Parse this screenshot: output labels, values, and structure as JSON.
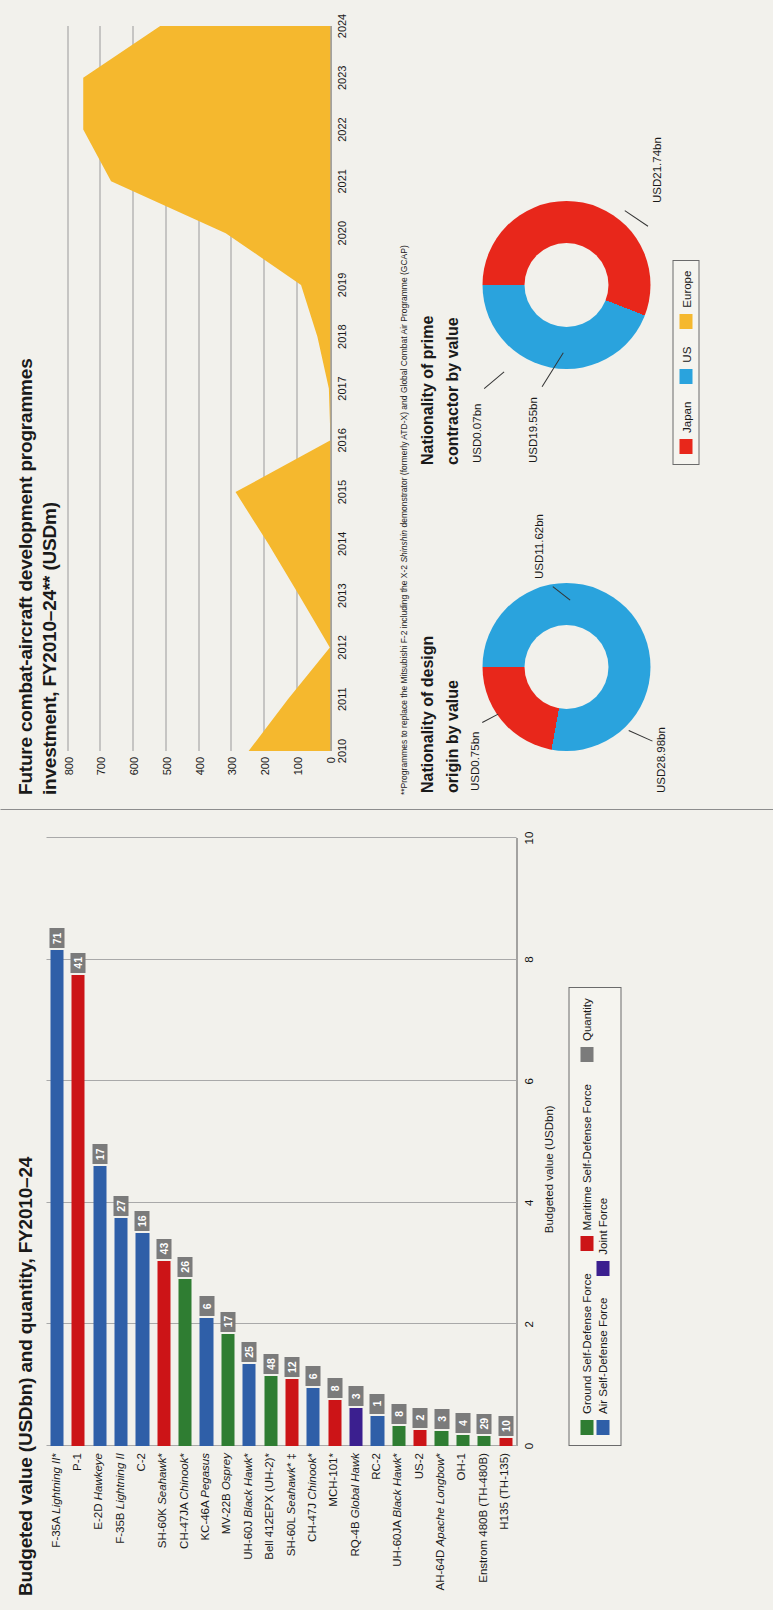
{
  "bar_panel": {
    "title": "Budgeted value (USDbn) and quantity, FY2010–24",
    "axis_title": "Budgeted value (USDbn)",
    "legend": [
      {
        "label": "Ground Self-Defense Force",
        "color": "#2f7d32"
      },
      {
        "label": "Maritime Self-Defense Force",
        "color": "#cc1417"
      },
      {
        "label": "Quantity",
        "color": "#7b7b7b"
      },
      {
        "label": "Air Self-Defense Force",
        "color": "#2f5fa8"
      },
      {
        "label": "Joint Force",
        "color": "#3b1f8f"
      }
    ]
  },
  "area_panel": {
    "title_line1": "Future combat-aircraft development programmes",
    "title_line2": "investment, FY2010–24** (USDm)",
    "footnote": "**Programmes to replace the Mitsubishi F-2 including the X-2 Shinshin demonstrator (formerly ATD-X) and Global Combat Air Programme (GCAP)",
    "footnote_italic": "Shinshin"
  },
  "donut_left": {
    "title_line1": "Nationality of design",
    "title_line2": "origin by value",
    "callouts": [
      {
        "name": "europe-callout",
        "text": "USD0.75bn"
      },
      {
        "name": "japan-callout",
        "text": "USD11.62bn"
      },
      {
        "name": "us-callout",
        "text": "USD28.98bn"
      }
    ]
  },
  "donut_right": {
    "title_line1": "Nationality of prime",
    "title_line2": "contractor by value",
    "callouts": [
      {
        "name": "europe-callout",
        "text": "USD0.07bn"
      },
      {
        "name": "us-callout",
        "text": "USD19.55bn"
      },
      {
        "name": "japan-callout",
        "text": "USD21.74bn"
      }
    ]
  },
  "donut_legend": [
    {
      "label": "Japan",
      "color": "#e8271b"
    },
    {
      "label": "US",
      "color": "#2aa3dd"
    },
    {
      "label": "Europe",
      "color": "#f5b82e"
    }
  ],
  "chart_data": [
    {
      "type": "bar",
      "name": "budgeted-value-and-quantity",
      "title": "Budgeted value (USDbn) and quantity, FY2010–24",
      "xlabel": "Budgeted value (USDbn)",
      "ylabel": "",
      "xlim": [
        0,
        10
      ],
      "xticks": [
        0,
        2,
        4,
        6,
        8,
        10
      ],
      "grid": true,
      "orientation": "horizontal",
      "legend_position": "bottom",
      "categories": [
        "F-35A Lightning II*",
        "P-1",
        "E-2D Hawkeye",
        "F-35B Lightning II",
        "C-2",
        "SH-60K Seahawk*",
        "CH-47JA Chinook*",
        "KC-46A Pegasus",
        "MV-22B Osprey",
        "UH-60J Black Hawk*",
        "Bell 412EPX (UH-2)*",
        "SH-60L Seahawk* ‡",
        "CH-47J Chinook*",
        "MCH-101*",
        "RQ-4B Global Hawk",
        "RC-2",
        "UH-60JA Black Hawk*",
        "US-2",
        "AH-64D Apache Longbow*",
        "OH-1",
        "Enstrom 480B (TH-480B)",
        "H135 (TH-135)"
      ],
      "italic_parts": [
        "Lightning II",
        "",
        "Hawkeye",
        "Lightning II",
        "",
        "Seahawk",
        "Chinook",
        "Pegasus",
        "Osprey",
        "Black Hawk",
        "",
        "Seahawk",
        "Chinook",
        "",
        "Global Hawk",
        "",
        "Black Hawk",
        "",
        "Apache Longbow",
        "",
        "",
        ""
      ],
      "values": [
        8.15,
        7.75,
        4.6,
        3.75,
        3.5,
        3.05,
        2.75,
        2.1,
        1.85,
        1.35,
        1.15,
        1.1,
        0.95,
        0.75,
        0.62,
        0.5,
        0.33,
        0.27,
        0.25,
        0.18,
        0.17,
        0.13
      ],
      "quantities": [
        71,
        41,
        17,
        27,
        16,
        43,
        26,
        6,
        17,
        25,
        48,
        12,
        6,
        8,
        3,
        1,
        8,
        2,
        3,
        4,
        29,
        10
      ],
      "series_colors": [
        "#2f5fa8",
        "#cc1417",
        "#2f5fa8",
        "#2f5fa8",
        "#2f5fa8",
        "#cc1417",
        "#2f7d32",
        "#2f5fa8",
        "#2f7d32",
        "#2f5fa8",
        "#2f7d32",
        "#cc1417",
        "#2f5fa8",
        "#cc1417",
        "#3b1f8f",
        "#2f5fa8",
        "#2f7d32",
        "#cc1417",
        "#2f7d32",
        "#2f7d32",
        "#2f7d32",
        "#cc1417"
      ],
      "force_of_category": [
        "Air Self-Defense Force",
        "Maritime Self-Defense Force",
        "Air Self-Defense Force",
        "Air Self-Defense Force",
        "Air Self-Defense Force",
        "Maritime Self-Defense Force",
        "Ground Self-Defense Force",
        "Air Self-Defense Force",
        "Ground Self-Defense Force",
        "Air Self-Defense Force",
        "Ground Self-Defense Force",
        "Maritime Self-Defense Force",
        "Air Self-Defense Force",
        "Maritime Self-Defense Force",
        "Joint Force",
        "Air Self-Defense Force",
        "Ground Self-Defense Force",
        "Maritime Self-Defense Force",
        "Ground Self-Defense Force",
        "Ground Self-Defense Force",
        "Ground Self-Defense Force",
        "Maritime Self-Defense Force"
      ]
    },
    {
      "type": "area",
      "name": "future-combat-aircraft-investment",
      "title": "Future combat-aircraft development programmes investment, FY2010–24** (USDm)",
      "xlabel": "",
      "ylabel": "USDm",
      "ylim": [
        0,
        800
      ],
      "yticks": [
        0,
        100,
        200,
        300,
        400,
        500,
        600,
        700,
        800
      ],
      "grid": true,
      "color": "#f5b82e",
      "x": [
        2010,
        2011,
        2012,
        2013,
        2014,
        2015,
        2016,
        2017,
        2018,
        2019,
        2020,
        2021,
        2022,
        2023,
        2024
      ],
      "values": [
        250,
        130,
        2,
        95,
        190,
        290,
        0,
        5,
        40,
        90,
        320,
        670,
        755,
        755,
        520
      ]
    },
    {
      "type": "pie",
      "name": "nationality-of-design-origin-by-value",
      "title": "Nationality of design origin by value",
      "labels": [
        "US",
        "Japan",
        "Europe"
      ],
      "values": [
        28.98,
        11.62,
        0.75
      ],
      "value_labels": [
        "USD28.98bn",
        "USD11.62bn",
        "USD0.75bn"
      ],
      "colors": [
        "#2aa3dd",
        "#e8271b",
        "#f5b82e"
      ],
      "legend_position": "bottom"
    },
    {
      "type": "pie",
      "name": "nationality-of-prime-contractor-by-value",
      "title": "Nationality of prime contractor by value",
      "labels": [
        "Japan",
        "US",
        "Europe"
      ],
      "values": [
        21.74,
        19.55,
        0.07
      ],
      "value_labels": [
        "USD21.74bn",
        "USD19.55bn",
        "USD0.07bn"
      ],
      "colors": [
        "#e8271b",
        "#2aa3dd",
        "#f5b82e"
      ],
      "legend_position": "bottom"
    }
  ]
}
